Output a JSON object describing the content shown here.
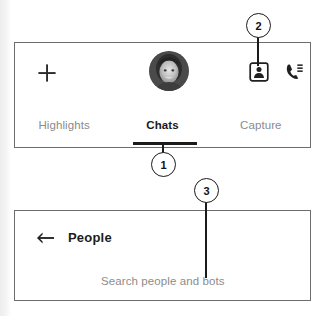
{
  "top_panel": {
    "appbar": {
      "add_icon": "plus-icon",
      "add_label": "+",
      "avatar": {
        "icon": "avatar-photo",
        "alt": "User profile photo"
      },
      "contact_icon": "contact-card-icon",
      "calls_icon": "call-log-icon"
    },
    "tabs": [
      {
        "label": "Highlights",
        "selected": false
      },
      {
        "label": "Chats",
        "selected": true
      },
      {
        "label": "Capture",
        "selected": false
      }
    ]
  },
  "bottom_panel": {
    "back_icon": "back-arrow-icon",
    "title": "People",
    "search_placeholder": "Search people and bots"
  },
  "callouts": [
    {
      "number": "1",
      "target": "chats-tab-indicator"
    },
    {
      "number": "2",
      "target": "contact-card-button"
    },
    {
      "number": "3",
      "target": "search-people-field"
    }
  ],
  "colors": {
    "panel_border": "#6d6d6d",
    "text_primary": "#1a1a1a",
    "text_muted": "#8b8b8b",
    "callout_stroke": "#1a1a1a",
    "indicator": "#1b1b1b"
  }
}
